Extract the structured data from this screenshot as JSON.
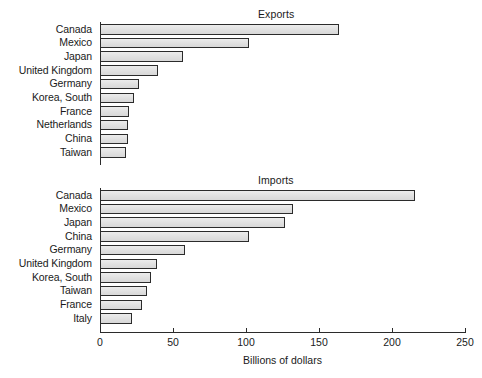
{
  "chart_data": {
    "type": "bar",
    "orientation": "horizontal",
    "title": "",
    "xlabel": "Billions of dollars",
    "ylabel": "",
    "xlim": [
      0,
      250
    ],
    "xticks": [
      0,
      50,
      100,
      150,
      200,
      250
    ],
    "xtick_labels": [
      "0",
      "50",
      "100",
      "150",
      "200",
      "250"
    ],
    "grid": false,
    "legend": null,
    "panels": [
      {
        "title": "Exports",
        "categories": [
          "Canada",
          "Mexico",
          "Japan",
          "United Kingdom",
          "Germany",
          "Korea, South",
          "France",
          "Netherlands",
          "China",
          "Taiwan"
        ],
        "values": [
          164,
          102,
          57,
          40,
          27,
          23,
          20,
          19,
          19,
          18
        ]
      },
      {
        "title": "Imports",
        "categories": [
          "Canada",
          "Mexico",
          "Japan",
          "China",
          "Germany",
          "United Kingdom",
          "Korea, South",
          "Taiwan",
          "France",
          "Italy"
        ],
        "values": [
          216,
          132,
          127,
          102,
          58,
          39,
          35,
          32,
          29,
          22
        ]
      }
    ],
    "colors": {
      "bar_fill": "#e2e2e2",
      "bar_edge": "#2b2b2b",
      "axis": "#2b2b2b",
      "text": "#1a1a1a",
      "background": "#ffffff"
    }
  }
}
